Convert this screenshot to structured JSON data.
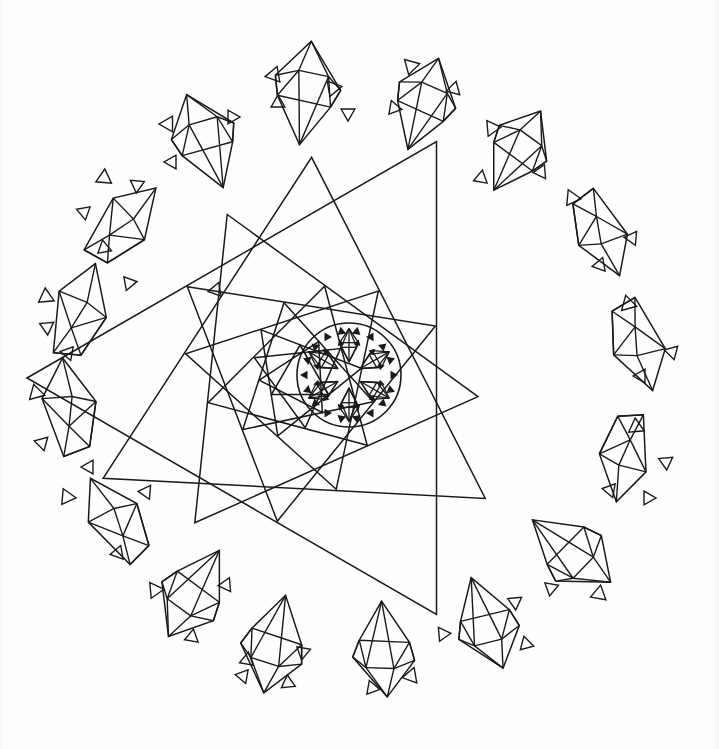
{
  "document": {
    "kind": "coloring-book-line-art",
    "title": "Gem Crystal Mandala",
    "width": 719,
    "height": 749,
    "background_color": "#fefefe",
    "line_color": "#1a1a1a",
    "line_width": 1.5
  },
  "canvas": {
    "paper_tone": "#fefefe",
    "edge_shadow_color": "#f4f4f4"
  },
  "center_mandala": {
    "label": "central circular snowflake medallion",
    "circle": {
      "cx": 349,
      "cy": 375,
      "r": 52
    },
    "gem_count": 6,
    "inner_gem_ring_radius": 30,
    "solid_triangle_ring_count": 18,
    "solid_triangle_ring_radius": 44,
    "solid_triangle_size": 5
  },
  "spiral": {
    "label": "rotating nested triangle starburst",
    "center_x": 300,
    "center_y": 378,
    "triangle_count": 11,
    "rotation_step_deg": 27,
    "scale_step": 1.235,
    "base_radius": 33,
    "triangles": [
      {
        "index": 0,
        "radius": 33,
        "rotation_deg": 0
      },
      {
        "index": 1,
        "radius": 41,
        "rotation_deg": 27
      },
      {
        "index": 2,
        "radius": 50,
        "rotation_deg": 54
      },
      {
        "index": 3,
        "radius": 62,
        "rotation_deg": 81
      },
      {
        "index": 4,
        "radius": 77,
        "rotation_deg": 108
      },
      {
        "index": 5,
        "radius": 95,
        "rotation_deg": 135
      },
      {
        "index": 6,
        "radius": 117,
        "rotation_deg": 162
      },
      {
        "index": 7,
        "radius": 145,
        "rotation_deg": 189
      },
      {
        "index": 8,
        "radius": 179,
        "rotation_deg": 216
      },
      {
        "index": 9,
        "radius": 221,
        "rotation_deg": 243
      },
      {
        "index": 10,
        "radius": 273,
        "rotation_deg": 270
      }
    ]
  },
  "gems": [
    {
      "id": "gem-top-center",
      "cx": 306,
      "cy": 92,
      "size": 52,
      "rotation_deg": 6,
      "style": "kite"
    },
    {
      "id": "gem-top-left",
      "cx": 205,
      "cy": 140,
      "size": 50,
      "rotation_deg": -22,
      "style": "kite"
    },
    {
      "id": "gem-top-right",
      "cx": 424,
      "cy": 103,
      "size": 48,
      "rotation_deg": 18,
      "style": "kite"
    },
    {
      "id": "gem-upper-right",
      "cx": 518,
      "cy": 150,
      "size": 46,
      "rotation_deg": 30,
      "style": "kite"
    },
    {
      "id": "gem-right-upper",
      "cx": 597,
      "cy": 232,
      "size": 48,
      "rotation_deg": 66,
      "style": "flat"
    },
    {
      "id": "gem-right-mid",
      "cx": 634,
      "cy": 343,
      "size": 50,
      "rotation_deg": 72,
      "style": "flat"
    },
    {
      "id": "gem-right-lower",
      "cx": 622,
      "cy": 453,
      "size": 48,
      "rotation_deg": 100,
      "style": "flat"
    },
    {
      "id": "gem-right-bottom",
      "cx": 572,
      "cy": 552,
      "size": 50,
      "rotation_deg": 128,
      "style": "kite"
    },
    {
      "id": "gem-bottom-right",
      "cx": 487,
      "cy": 624,
      "size": 48,
      "rotation_deg": 160,
      "style": "kite"
    },
    {
      "id": "gem-bottom-center",
      "cx": 384,
      "cy": 650,
      "size": 48,
      "rotation_deg": 176,
      "style": "kite"
    },
    {
      "id": "gem-bottom-left",
      "cx": 274,
      "cy": 645,
      "size": 50,
      "rotation_deg": 192,
      "style": "kite"
    },
    {
      "id": "gem-lower-left",
      "cx": 193,
      "cy": 594,
      "size": 50,
      "rotation_deg": 210,
      "style": "kite"
    },
    {
      "id": "gem-left-lower",
      "cx": 120,
      "cy": 520,
      "size": 50,
      "rotation_deg": 238,
      "style": "flat"
    },
    {
      "id": "gem-left-mid",
      "cx": 73,
      "cy": 410,
      "size": 52,
      "rotation_deg": 262,
      "style": "flat"
    },
    {
      "id": "gem-left-upper",
      "cx": 82,
      "cy": 315,
      "size": 52,
      "rotation_deg": 288,
      "style": "flat"
    },
    {
      "id": "gem-upper-left",
      "cx": 124,
      "cy": 228,
      "size": 50,
      "rotation_deg": 312,
      "style": "flat"
    }
  ],
  "sparkles": [
    {
      "cx": 274,
      "cy": 75,
      "size": 9,
      "rotation_deg": 20
    },
    {
      "cx": 333,
      "cy": 88,
      "size": 9,
      "rotation_deg": 200
    },
    {
      "cx": 278,
      "cy": 103,
      "size": 8,
      "rotation_deg": 120
    },
    {
      "cx": 348,
      "cy": 113,
      "size": 8,
      "rotation_deg": 300
    },
    {
      "cx": 168,
      "cy": 124,
      "size": 9,
      "rotation_deg": 30
    },
    {
      "cx": 232,
      "cy": 117,
      "size": 8,
      "rotation_deg": 210
    },
    {
      "cx": 172,
      "cy": 162,
      "size": 8,
      "rotation_deg": 150
    },
    {
      "cx": 411,
      "cy": 66,
      "size": 9,
      "rotation_deg": 195
    },
    {
      "cx": 454,
      "cy": 89,
      "size": 8,
      "rotation_deg": 15
    },
    {
      "cx": 394,
      "cy": 108,
      "size": 8,
      "rotation_deg": 100
    },
    {
      "cx": 492,
      "cy": 128,
      "size": 9,
      "rotation_deg": 205
    },
    {
      "cx": 541,
      "cy": 172,
      "size": 8,
      "rotation_deg": 25
    },
    {
      "cx": 481,
      "cy": 178,
      "size": 8,
      "rotation_deg": 130
    },
    {
      "cx": 572,
      "cy": 198,
      "size": 9,
      "rotation_deg": 215
    },
    {
      "cx": 632,
      "cy": 238,
      "size": 8,
      "rotation_deg": 35
    },
    {
      "cx": 600,
      "cy": 265,
      "size": 8,
      "rotation_deg": 140
    },
    {
      "cx": 628,
      "cy": 304,
      "size": 9,
      "rotation_deg": 225
    },
    {
      "cx": 672,
      "cy": 352,
      "size": 8,
      "rotation_deg": 45
    },
    {
      "cx": 641,
      "cy": 376,
      "size": 8,
      "rotation_deg": 150
    },
    {
      "cx": 636,
      "cy": 427,
      "size": 9,
      "rotation_deg": 235
    },
    {
      "cx": 666,
      "cy": 462,
      "size": 8,
      "rotation_deg": 55
    },
    {
      "cx": 610,
      "cy": 490,
      "size": 8,
      "rotation_deg": 160
    },
    {
      "cx": 648,
      "cy": 498,
      "size": 8,
      "rotation_deg": 330
    },
    {
      "cx": 599,
      "cy": 594,
      "size": 9,
      "rotation_deg": 250
    },
    {
      "cx": 551,
      "cy": 588,
      "size": 8,
      "rotation_deg": 70
    },
    {
      "cx": 515,
      "cy": 602,
      "size": 8,
      "rotation_deg": 175
    },
    {
      "cx": 526,
      "cy": 644,
      "size": 8,
      "rotation_deg": 345
    },
    {
      "cx": 443,
      "cy": 634,
      "size": 8,
      "rotation_deg": 85
    },
    {
      "cx": 411,
      "cy": 676,
      "size": 9,
      "rotation_deg": 260
    },
    {
      "cx": 372,
      "cy": 688,
      "size": 8,
      "rotation_deg": 100
    },
    {
      "cx": 303,
      "cy": 652,
      "size": 8,
      "rotation_deg": 190
    },
    {
      "cx": 247,
      "cy": 660,
      "size": 8,
      "rotation_deg": 10
    },
    {
      "cx": 243,
      "cy": 676,
      "size": 8,
      "rotation_deg": 280
    },
    {
      "cx": 288,
      "cy": 683,
      "size": 8,
      "rotation_deg": 115
    },
    {
      "cx": 155,
      "cy": 590,
      "size": 9,
      "rotation_deg": 205
    },
    {
      "cx": 226,
      "cy": 585,
      "size": 8,
      "rotation_deg": 25
    },
    {
      "cx": 192,
      "cy": 637,
      "size": 8,
      "rotation_deg": 130
    },
    {
      "cx": 67,
      "cy": 497,
      "size": 9,
      "rotation_deg": 215
    },
    {
      "cx": 146,
      "cy": 492,
      "size": 8,
      "rotation_deg": 35
    },
    {
      "cx": 118,
      "cy": 553,
      "size": 8,
      "rotation_deg": 140
    },
    {
      "cx": 36,
      "cy": 393,
      "size": 9,
      "rotation_deg": 225
    },
    {
      "cx": 42,
      "cy": 443,
      "size": 8,
      "rotation_deg": 45
    },
    {
      "cx": 89,
      "cy": 467,
      "size": 8,
      "rotation_deg": 150
    },
    {
      "cx": 46,
      "cy": 297,
      "size": 9,
      "rotation_deg": 235
    },
    {
      "cx": 47,
      "cy": 327,
      "size": 8,
      "rotation_deg": 55
    },
    {
      "cx": 68,
      "cy": 353,
      "size": 8,
      "rotation_deg": 160
    },
    {
      "cx": 104,
      "cy": 178,
      "size": 9,
      "rotation_deg": 245
    },
    {
      "cx": 137,
      "cy": 185,
      "size": 8,
      "rotation_deg": 65
    },
    {
      "cx": 84,
      "cy": 212,
      "size": 8,
      "rotation_deg": 170
    },
    {
      "cx": 104,
      "cy": 248,
      "size": 8,
      "rotation_deg": 350
    },
    {
      "cx": 129,
      "cy": 283,
      "size": 8,
      "rotation_deg": 80
    },
    {
      "cx": 216,
      "cy": 290,
      "size": 8,
      "rotation_deg": 260
    }
  ]
}
